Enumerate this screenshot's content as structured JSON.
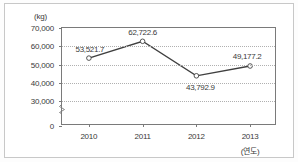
{
  "chart_data": {
    "type": "line",
    "title": "",
    "subtitle": "",
    "xlabel": "(연도)",
    "ylabel": "(kg)",
    "categories": [
      "2010",
      "2011",
      "2012",
      "2013"
    ],
    "values": [
      53521.7,
      62722.6,
      43792.9,
      49177.2
    ],
    "point_labels": [
      "53,521.7",
      "62,722.6",
      "43,792.9",
      "49,177.2"
    ],
    "series": [
      {
        "name": "",
        "values": [
          53521.7,
          62722.6,
          43792.9,
          49177.2
        ]
      }
    ],
    "ylim": [
      20000,
      70000
    ],
    "y_ticks": [
      0,
      30000,
      40000,
      50000,
      60000,
      70000
    ],
    "y_tick_labels": [
      "0",
      "30,000",
      "40,000",
      "50,000",
      "60,000",
      "70,000"
    ],
    "grid": true,
    "grid_style": "dotted-horizontal",
    "legend": false,
    "legend_position": "none",
    "axis_break": true,
    "marker": "open-circle",
    "line_color": "#3f3f3f",
    "marker_color": "#ffffff",
    "marker_border_color": "#3f3f3f",
    "grid_color": "#b0b0b0",
    "axis_color": "#7a7a7a",
    "text_color": "#3a3a3a",
    "background_color": "#ffffff"
  },
  "axes": {
    "y_unit_label": "(kg)",
    "x_unit_label": "(연도)",
    "y_ticks": [
      {
        "label": "70,000",
        "value": 70000
      },
      {
        "label": "60,000",
        "value": 60000
      },
      {
        "label": "50,000",
        "value": 50000
      },
      {
        "label": "40,000",
        "value": 40000
      },
      {
        "label": "30,000",
        "value": 30000
      },
      {
        "label": "0",
        "value": 0
      }
    ],
    "x_ticks": [
      {
        "label": "2010"
      },
      {
        "label": "2011"
      },
      {
        "label": "2012"
      },
      {
        "label": "2013"
      }
    ]
  },
  "points": [
    {
      "category": "2010",
      "label": "53,521.7",
      "value": 53521.7
    },
    {
      "category": "2011",
      "label": "62,722.6",
      "value": 62722.6
    },
    {
      "category": "2012",
      "label": "43,792.9",
      "value": 43792.9
    },
    {
      "category": "2013",
      "label": "49,177.2",
      "value": 49177.2
    }
  ]
}
